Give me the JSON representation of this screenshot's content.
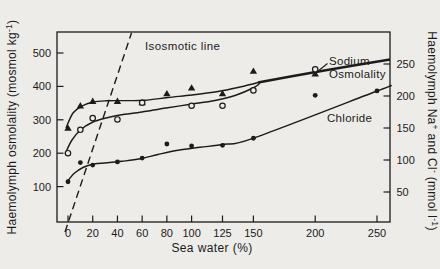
{
  "figure": {
    "background": "#edece9",
    "ink": "#1b1b1b"
  },
  "chart_data": {
    "type": "scatter",
    "title": "",
    "xlabel": "Sea water (%)",
    "x_ticks": [
      0,
      20,
      40,
      60,
      80,
      100,
      125,
      150,
      200,
      250
    ],
    "x_range": [
      -9,
      260
    ],
    "grid": false,
    "y_left": {
      "label": "Haemolymph osmolality (mosmol kg⁻¹)",
      "ticks": [
        100,
        200,
        300,
        400,
        500
      ],
      "range": [
        0,
        565
      ]
    },
    "y_right": {
      "label": "Haemolymph Na⁺ and Cl⁻ (mmol l⁻¹)",
      "ticks": [
        50,
        100,
        150,
        200,
        250
      ],
      "range": [
        0,
        300
      ]
    },
    "series": [
      {
        "name": "Sodium",
        "axis": "right",
        "marker": "filled-triangle",
        "points": [
          [
            0,
            150
          ],
          [
            10,
            185
          ],
          [
            20,
            192
          ],
          [
            40,
            192
          ],
          [
            60,
            190
          ],
          [
            80,
            204
          ],
          [
            100,
            213
          ],
          [
            125,
            204
          ],
          [
            150,
            239
          ],
          [
            200,
            235
          ]
        ]
      },
      {
        "name": "Osmolality",
        "axis": "left",
        "marker": "open-circle",
        "points": [
          [
            0,
            200
          ],
          [
            10,
            270
          ],
          [
            20,
            305
          ],
          [
            40,
            301
          ],
          [
            60,
            351
          ],
          [
            100,
            342
          ],
          [
            125,
            342
          ],
          [
            150,
            388
          ],
          [
            200,
            451
          ]
        ]
      },
      {
        "name": "Chloride",
        "axis": "right",
        "marker": "filled-circle",
        "points": [
          [
            0,
            66
          ],
          [
            10,
            96
          ],
          [
            20,
            92
          ],
          [
            40,
            97
          ],
          [
            60,
            103
          ],
          [
            80,
            125
          ],
          [
            100,
            122
          ],
          [
            125,
            123
          ],
          [
            150,
            134
          ],
          [
            200,
            201
          ],
          [
            250,
            208
          ]
        ]
      }
    ],
    "reference_line": {
      "label": "Isosmotic line",
      "style": "dashed",
      "slope_mosmol_per_percent": 11,
      "intercept_mosmol": 0
    },
    "legend_position": "labels-on-chart"
  }
}
